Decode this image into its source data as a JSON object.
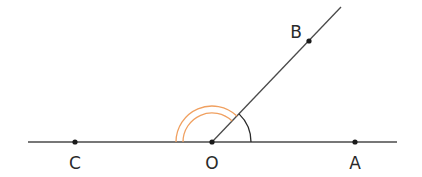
{
  "diagram": {
    "type": "geometry-angles",
    "colors": {
      "line": "#4a4a4a",
      "point": "#1a1a1a",
      "arc_aob": "#2a2a2a",
      "arc_boc": "#f0a060",
      "label": "#2a2a2a"
    },
    "line_ca": {
      "x1": 28,
      "y1": 142,
      "x2": 397,
      "y2": 142
    },
    "ray_ob": {
      "x1": 212,
      "y1": 142,
      "x2": 341,
      "y2": 7
    },
    "points": [
      {
        "name": "C",
        "x": 75,
        "y": 142,
        "label_x": 75,
        "label_y": 163
      },
      {
        "name": "O",
        "x": 212,
        "y": 142,
        "label_x": 212,
        "label_y": 163
      },
      {
        "name": "A",
        "x": 355,
        "y": 142,
        "label_x": 355,
        "label_y": 163
      },
      {
        "name": "B",
        "x": 309,
        "y": 41,
        "label_x": 296,
        "label_y": 32
      }
    ],
    "angle_marks": {
      "aob": {
        "vertex": "O",
        "radius": 39,
        "arcs": 1
      },
      "boc": {
        "vertex": "O",
        "radii": [
          29,
          36
        ],
        "arcs": 2
      }
    },
    "labels": {
      "c": "C",
      "o": "O",
      "a": "A",
      "b": "B"
    }
  }
}
